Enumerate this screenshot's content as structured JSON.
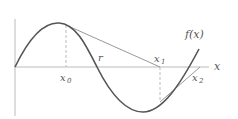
{
  "diagram": {
    "labels": {
      "function": "f(x)",
      "x_axis": "x",
      "root": "r",
      "x0": "x",
      "x0_sub": "0",
      "x1": "x",
      "x1_sub": "1",
      "x2": "x",
      "x2_sub": "2"
    },
    "colors": {
      "curve": "#555555",
      "axis": "#bbbbbb",
      "tangent": "#999999",
      "dashed": "#bbbbbb",
      "text": "#555555"
    }
  }
}
